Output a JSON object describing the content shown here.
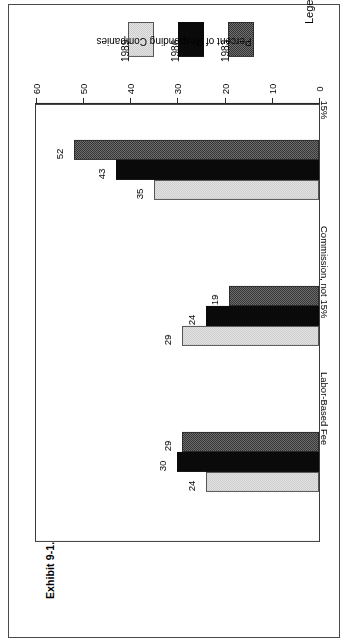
{
  "exhibit": {
    "prefix": "Exhibit 9-1.",
    "title": "Trends in Compensating Advertising Agencies",
    "full_title": "Exhibit 9-1. Trends in Compensating Advertising Agencies"
  },
  "legend": {
    "label": "Legend :",
    "items": [
      {
        "name": "1983",
        "swatch": "dark-checkered-swatch",
        "color": "#717171"
      },
      {
        "name": "1986",
        "swatch": "solid-black-swatch",
        "color": "#0a0a0a"
      },
      {
        "name": "1989",
        "swatch": "light-gray-swatch",
        "color": "#e4e4e4"
      }
    ]
  },
  "chart_data": {
    "type": "bar",
    "orientation": "horizontal",
    "title": "Exhibit 9-1. Trends in Compensating Advertising Agencies",
    "xlabel": "",
    "ylabel": "Percent of Responding Companies",
    "value_axis_label": "Percent of Responding Companies",
    "categories": [
      "15%",
      "Commission, not 15%",
      "Labor-Based Fee"
    ],
    "series": [
      {
        "name": "1983",
        "values": [
          52,
          19,
          29
        ]
      },
      {
        "name": "1986",
        "values": [
          43,
          24,
          30
        ]
      },
      {
        "name": "1989",
        "values": [
          35,
          29,
          24
        ]
      }
    ],
    "ylim": [
      0,
      60
    ],
    "axis_ticks": [
      0,
      10,
      20,
      30,
      40,
      50,
      60
    ],
    "grid": false,
    "legend_position": "top-outside",
    "data_labels": true
  }
}
